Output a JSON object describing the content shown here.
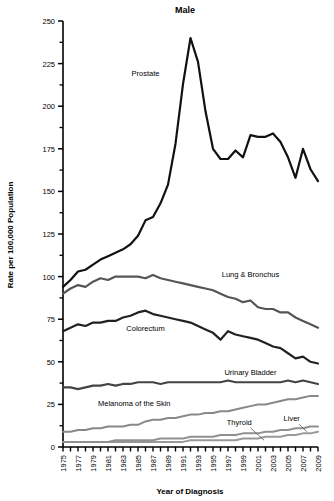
{
  "chart_data": {
    "type": "line",
    "title": "Male",
    "subtitle": "",
    "xlabel": "Year of Diagnosis",
    "ylabel": "Rate per 100,000 Population",
    "xlim": [
      1975,
      2009
    ],
    "ylim": [
      0,
      250
    ],
    "ytick_major": [
      0,
      25,
      50,
      75,
      100,
      125,
      150,
      175,
      200,
      225,
      250
    ],
    "ytick_minor_step": 12.5,
    "xticks": [
      "1975",
      "1977",
      "1979",
      "1981",
      "1983",
      "1985",
      "1987",
      "1989",
      "1991",
      "1993",
      "1995",
      "1997",
      "1999",
      "2001",
      "2003",
      "2005",
      "2007",
      "2009"
    ],
    "xtick_minor_step": 1,
    "grid": false,
    "legend": "inline-annotations",
    "x": [
      1975,
      1976,
      1977,
      1978,
      1979,
      1980,
      1981,
      1982,
      1983,
      1984,
      1985,
      1986,
      1987,
      1988,
      1989,
      1990,
      1991,
      1992,
      1993,
      1994,
      1995,
      1996,
      1997,
      1998,
      1999,
      2000,
      2001,
      2002,
      2003,
      2004,
      2005,
      2006,
      2007,
      2008,
      2009
    ],
    "series": [
      {
        "name": "Prostate",
        "color": "#111111",
        "width": 2.2,
        "label_x": 1986.0,
        "label_y": 218,
        "values": [
          94,
          98,
          103,
          104,
          107,
          110,
          112,
          114,
          116,
          119,
          124,
          133,
          135,
          143,
          154,
          178,
          213,
          240,
          226,
          197,
          175,
          169,
          169,
          174,
          170,
          183,
          182,
          182,
          184,
          179,
          170,
          158,
          175,
          163,
          156
        ]
      },
      {
        "name": "Lung & Bronchus",
        "color": "#555555",
        "width": 2.2,
        "label_x": 2000.0,
        "label_y": 100,
        "values": [
          90,
          93,
          95,
          94,
          97,
          99,
          98,
          100,
          100,
          100,
          100,
          99,
          101,
          99,
          98,
          97,
          96,
          95,
          94,
          93,
          92,
          90,
          88,
          87,
          85,
          86,
          82,
          81,
          81,
          79,
          79,
          76,
          74,
          72,
          70
        ]
      },
      {
        "name": "Colorectum",
        "color": "#222222",
        "width": 2.2,
        "label_x": 1986.0,
        "label_y": 68,
        "values": [
          68,
          70,
          72,
          71,
          73,
          73,
          74,
          74,
          76,
          77,
          79,
          80,
          78,
          77,
          76,
          75,
          74,
          73,
          71,
          69,
          67,
          63,
          68,
          66,
          65,
          64,
          63,
          61,
          59,
          58,
          55,
          52,
          53,
          50,
          49
        ]
      },
      {
        "name": "Urinary Bladder",
        "color": "#444444",
        "width": 2.2,
        "label_x": 2000.0,
        "label_y": 42,
        "values": [
          35,
          35,
          34,
          35,
          36,
          36,
          37,
          36,
          37,
          37,
          38,
          38,
          38,
          37,
          38,
          38,
          38,
          38,
          38,
          38,
          38,
          38,
          39,
          38,
          38,
          38,
          38,
          38,
          38,
          38,
          39,
          38,
          39,
          38,
          37
        ]
      },
      {
        "name": "Melanoma of the Skin",
        "color": "#888888",
        "width": 2.0,
        "label_x": 1984.5,
        "label_y": 24,
        "values": [
          9,
          9,
          10,
          10,
          11,
          11,
          12,
          12,
          12,
          13,
          13,
          15,
          16,
          16,
          17,
          17,
          18,
          19,
          19,
          20,
          20,
          21,
          21,
          22,
          23,
          24,
          25,
          25,
          26,
          27,
          28,
          28,
          29,
          30,
          30
        ]
      },
      {
        "name": "Thyroid",
        "color": "#999999",
        "width": 2.0,
        "label_x": 1998.5,
        "label_y": 13,
        "leader": [
          [
            2000.0,
            11.2
          ],
          [
            2001.8,
            4.0
          ]
        ],
        "values": [
          3,
          3,
          3,
          3,
          3,
          3,
          3,
          3,
          3,
          3,
          3,
          3,
          3,
          3,
          3,
          3,
          3,
          4,
          4,
          4,
          4,
          4,
          4,
          4,
          5,
          5,
          5,
          6,
          6,
          6,
          7,
          7,
          8,
          8,
          9
        ]
      },
      {
        "name": "Liver",
        "color": "#909090",
        "width": 2.0,
        "label_x": 2005.5,
        "label_y": 15,
        "leader": [
          [
            2006.5,
            13.3
          ],
          [
            2007.5,
            9.0
          ]
        ],
        "values": [
          3,
          3,
          3,
          3,
          3,
          3,
          3,
          4,
          4,
          4,
          4,
          4,
          4,
          5,
          5,
          5,
          5,
          6,
          6,
          6,
          6,
          7,
          7,
          7,
          8,
          8,
          8,
          9,
          9,
          10,
          10,
          11,
          11,
          12,
          12
        ]
      }
    ]
  }
}
